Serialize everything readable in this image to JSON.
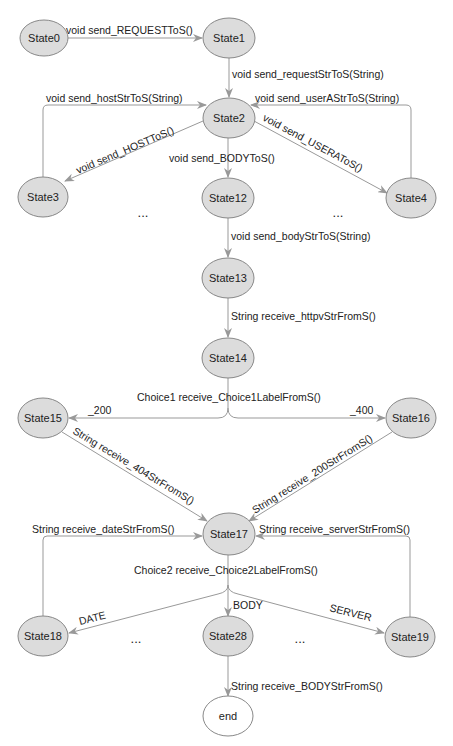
{
  "diagram": {
    "type": "state-machine",
    "colors": {
      "node_fill": "#dcdcdc",
      "final_fill": "#ffffff",
      "stroke": "#888888",
      "edge": "#999999"
    },
    "nodes": {
      "s0": "State0",
      "s1": "State1",
      "s2": "State2",
      "s3": "State3",
      "s4": "State4",
      "s12": "State12",
      "s13": "State13",
      "s14": "State14",
      "s15": "State15",
      "s16": "State16",
      "s17": "State17",
      "s18": "State18",
      "s19": "State19",
      "s28": "State28",
      "end": "end"
    },
    "edges": {
      "e0_1": "void send_REQUESTToS()",
      "e1_2": "void send_requestStrToS(String)",
      "e3_2": "void send_hostStrToS(String)",
      "e4_2": "void send_userAStrToS(String)",
      "e2_3": "void send_HOSTToS()",
      "e2_4": "void send_USERAToS()",
      "e2_12": "void send_BODYToS()",
      "e12_13": "void send_bodyStrToS(String)",
      "e13_14": "String receive_httpvStrFromS()",
      "choice1": "Choice1 receive_Choice1LabelFromS()",
      "e14_15": "_200",
      "e14_16": "_400",
      "e15_17": "String receive_404StrFromS()",
      "e16_17": "String receive_200StrFromS()",
      "e18_17": "String receive_dateStrFromS()",
      "e19_17": "String receive_serverStrFromS()",
      "choice2": "Choice2 receive_Choice2LabelFromS()",
      "e17_18": "DATE",
      "e17_28": "BODY",
      "e17_19": "SERVER",
      "e28_end": "String receive_BODYStrFromS()"
    },
    "ellipsis": "..."
  }
}
